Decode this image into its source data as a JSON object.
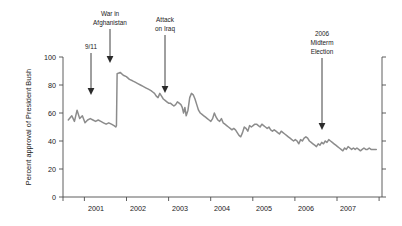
{
  "chart_data": {
    "type": "line",
    "title": "",
    "subtitle": "",
    "xlabel": "",
    "ylabel": "Percent approval of President Bush",
    "ylim": [
      0,
      100
    ],
    "yticks": [
      0,
      20,
      40,
      60,
      80,
      100
    ],
    "ytick_labels": [
      "0",
      "20",
      "40",
      "60",
      "80",
      "100"
    ],
    "xlim": [
      2000.5,
      2007.75
    ],
    "xticks": [
      2001,
      2002,
      2003,
      2004,
      2005,
      2006,
      2007
    ],
    "xtick_labels": [
      "2001",
      "2002",
      "2003",
      "2004",
      "2005",
      "2006",
      "2007"
    ],
    "grid": false,
    "legend": "none",
    "series": [
      {
        "name": "Percent approval of President Bush",
        "color": "#8c8c8c",
        "x": [
          2000.62,
          2000.7,
          2000.76,
          2000.82,
          2000.88,
          2000.94,
          2001.0,
          2001.06,
          2001.12,
          2001.18,
          2001.24,
          2001.3,
          2001.36,
          2001.42,
          2001.48,
          2001.54,
          2001.6,
          2001.66,
          2001.7,
          2001.715,
          2001.73,
          2001.8,
          2001.87,
          2001.94,
          2002.01,
          2002.08,
          2002.14,
          2002.2,
          2002.26,
          2002.32,
          2002.38,
          2002.44,
          2002.5,
          2002.54,
          2002.58,
          2002.62,
          2002.66,
          2002.7,
          2002.74,
          2002.78,
          2002.82,
          2002.86,
          2002.9,
          2002.94,
          2002.98,
          2003.02,
          2003.06,
          2003.1,
          2003.14,
          2003.18,
          2003.21,
          2003.24,
          2003.27,
          2003.3,
          2003.34,
          2003.38,
          2003.42,
          2003.46,
          2003.5,
          2003.54,
          2003.58,
          2003.62,
          2003.66,
          2003.7,
          2003.74,
          2003.78,
          2003.82,
          2003.86,
          2003.9,
          2003.94,
          2003.98,
          2004.02,
          2004.06,
          2004.1,
          2004.14,
          2004.18,
          2004.22,
          2004.26,
          2004.3,
          2004.34,
          2004.38,
          2004.42,
          2004.46,
          2004.5,
          2004.54,
          2004.58,
          2004.62,
          2004.66,
          2004.7,
          2004.74,
          2004.78,
          2004.82,
          2004.86,
          2004.9,
          2004.94,
          2004.98,
          2005.02,
          2005.06,
          2005.1,
          2005.14,
          2005.18,
          2005.22,
          2005.26,
          2005.3,
          2005.34,
          2005.38,
          2005.42,
          2005.46,
          2005.5,
          2005.54,
          2005.58,
          2005.62,
          2005.66,
          2005.7,
          2005.74,
          2005.78,
          2005.82,
          2005.86,
          2005.9,
          2005.94,
          2005.98,
          2006.02,
          2006.06,
          2006.1,
          2006.14,
          2006.18,
          2006.22,
          2006.26,
          2006.3,
          2006.34,
          2006.38,
          2006.42,
          2006.46,
          2006.5,
          2006.54,
          2006.58,
          2006.62,
          2006.66,
          2006.7,
          2006.74,
          2006.78,
          2006.82,
          2006.86,
          2006.9,
          2006.94,
          2006.98,
          2007.02,
          2007.06,
          2007.1,
          2007.14,
          2007.18,
          2007.22,
          2007.26,
          2007.3,
          2007.34,
          2007.38,
          2007.42,
          2007.46,
          2007.5,
          2007.56,
          2007.62
        ],
        "y": [
          55,
          58,
          54,
          62,
          56,
          58,
          53,
          55,
          56,
          55,
          54,
          55,
          54,
          53,
          52,
          53,
          52,
          51,
          50,
          51,
          88,
          89,
          87,
          86,
          84,
          83,
          82,
          81,
          80,
          79,
          78,
          77,
          76,
          75,
          74,
          72,
          71,
          74,
          72,
          70,
          69,
          68,
          67,
          67,
          66,
          65,
          66,
          68,
          67,
          66,
          64,
          60,
          64,
          58,
          62,
          71,
          74,
          73,
          70,
          66,
          62,
          60,
          59,
          58,
          57,
          56,
          55,
          54,
          56,
          60,
          57,
          55,
          54,
          56,
          53,
          52,
          51,
          50,
          49,
          48,
          49,
          48,
          46,
          44,
          43,
          46,
          50,
          49,
          47,
          51,
          50,
          51,
          52,
          52,
          51,
          50,
          52,
          51,
          50,
          49,
          50,
          48,
          47,
          48,
          47,
          46,
          45,
          47,
          46,
          45,
          44,
          43,
          42,
          41,
          40,
          41,
          40,
          38,
          41,
          40,
          42,
          43,
          42,
          40,
          39,
          38,
          37,
          36,
          38,
          37,
          39,
          38,
          40,
          39,
          41,
          40,
          39,
          38,
          37,
          36,
          35,
          34,
          33,
          35,
          34,
          36,
          35,
          34,
          35,
          34,
          35,
          34,
          33,
          34,
          35,
          34,
          34,
          35,
          34,
          34,
          34
        ]
      }
    ],
    "annotations": [
      {
        "id": "annotation-9-11",
        "label": "9/11",
        "lines": [
          "9/11"
        ],
        "x": 2001.7,
        "y": 72,
        "arrow": "down"
      },
      {
        "id": "annotation-war-in-afghanistan",
        "label": "War in Afghanistan",
        "lines": [
          "War in",
          "Afghanistan"
        ],
        "x": 2001.86,
        "y": 90,
        "arrow": "down"
      },
      {
        "id": "annotation-attack-on-iraq",
        "label": "Attack on Iraq",
        "lines": [
          "Attack",
          "on Iraq"
        ],
        "x": 2003.2,
        "y": 74,
        "arrow": "down"
      },
      {
        "id": "annotation-2006-midterm-election",
        "label": "2006 Midterm Election",
        "lines": [
          "2006",
          "Midterm",
          "Election"
        ],
        "x": 2006.3,
        "y": 50,
        "arrow": "down"
      }
    ],
    "colors": {
      "line": "#8c8c8c",
      "axis": "#4d4d4d",
      "text": "#1a1a1a",
      "arrow": "#2b2b2b",
      "background": "#ffffff"
    }
  }
}
